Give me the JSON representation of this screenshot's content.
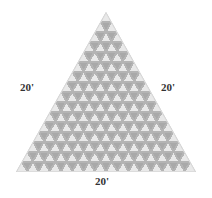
{
  "figure": {
    "shape": "equilateral-triangle",
    "rows": 16,
    "apex": {
      "x": 106,
      "y": 12
    },
    "base_left": {
      "x": 16,
      "y": 172
    },
    "base_right": {
      "x": 196,
      "y": 172
    },
    "colors": {
      "tile_light": "#e9e9e9",
      "tile_dark": "#a9a9a9",
      "fill_background": "#b4b4b4",
      "edge_light": "#dcdcdc",
      "text": "#333333",
      "page_background": "#ffffff"
    }
  },
  "labels": {
    "left": "20'",
    "right": "20'",
    "base": "20'"
  },
  "chart_data": {
    "type": "diagram",
    "shape": "equilateral triangle",
    "side_lengths": [
      "20'",
      "20'",
      "20'"
    ],
    "unit": "feet",
    "subdivisions_per_side": 16,
    "upward_tiles_total": 256,
    "downward_tiles_total": 240,
    "tiles_total": 496,
    "rows": [
      {
        "row": 1,
        "upward": 1,
        "downward": 0
      },
      {
        "row": 2,
        "upward": 2,
        "downward": 1
      },
      {
        "row": 3,
        "upward": 3,
        "downward": 2
      },
      {
        "row": 4,
        "upward": 4,
        "downward": 3
      },
      {
        "row": 5,
        "upward": 5,
        "downward": 4
      },
      {
        "row": 6,
        "upward": 6,
        "downward": 5
      },
      {
        "row": 7,
        "upward": 7,
        "downward": 6
      },
      {
        "row": 8,
        "upward": 8,
        "downward": 7
      },
      {
        "row": 9,
        "upward": 9,
        "downward": 8
      },
      {
        "row": 10,
        "upward": 10,
        "downward": 9
      },
      {
        "row": 11,
        "upward": 11,
        "downward": 10
      },
      {
        "row": 12,
        "upward": 12,
        "downward": 11
      },
      {
        "row": 13,
        "upward": 13,
        "downward": 12
      },
      {
        "row": 14,
        "upward": 14,
        "downward": 13
      },
      {
        "row": 15,
        "upward": 15,
        "downward": 14
      },
      {
        "row": 16,
        "upward": 16,
        "downward": 15
      }
    ]
  }
}
